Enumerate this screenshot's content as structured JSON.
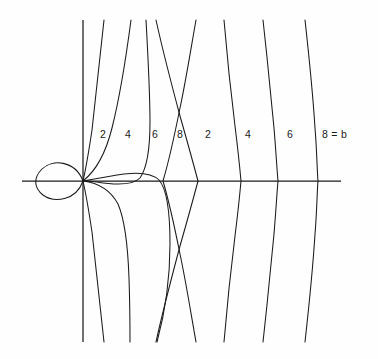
{
  "figure": {
    "title": "",
    "background_color": "#fefefe",
    "stroke_color": "#1a1a1a",
    "axes": {
      "origin": {
        "x": 83,
        "y": 181
      },
      "horizontal_axis": {
        "name": "x-axis",
        "x1": 22,
        "y1": 181,
        "x2": 341,
        "y2": 181
      },
      "vertical_axis": {
        "name": "y-axis",
        "x1": 83,
        "y1": 20,
        "x2": 83,
        "y2": 342
      }
    },
    "labels": [
      {
        "text": "2",
        "x": 103,
        "y": 134
      },
      {
        "text": "4",
        "x": 128,
        "y": 134
      },
      {
        "text": "6",
        "x": 155,
        "y": 134
      },
      {
        "text": "8",
        "x": 180,
        "y": 134
      },
      {
        "text": "2",
        "x": 208,
        "y": 134
      },
      {
        "text": "4",
        "x": 248,
        "y": 134
      },
      {
        "text": "6",
        "x": 290,
        "y": 134
      },
      {
        "text": "8 = b",
        "x": 322,
        "y": 134
      }
    ],
    "loop": {
      "name": "cardioid-loop",
      "path": "M 83 181 C 75 160 52 159 42 169 C 33 178 34 188 43 195 C 54 203 76 201 83 181 Z",
      "left_extent_x": 38,
      "right_extent_x": 84,
      "top_extent_y": 161,
      "bottom_extent_y": 200
    },
    "curves": [
      {
        "name": "curve-left-2",
        "label": "2",
        "axis_crossing_x": null,
        "path": "M 104 20 C 100 58 96 96 92 130 C 89 150 86 168 83 181 C 86 194 89 212 92 232 C 96 266 100 304 104 342"
      },
      {
        "name": "curve-left-4",
        "label": "4",
        "axis_crossing_x": 121,
        "path": "M 131 20 C 126 58 120 96 112 128 C 106 152 97 170 83 181 C 99 183 111 191 118 204 C 125 220 128 250 129 278 C 130 308 130 328 130 342"
      },
      {
        "name": "curve-left-6",
        "label": "6",
        "axis_crossing_x": 159,
        "path": "M 146 20 C 148 56 150 92 150 122 C 150 148 147 168 140 178 C 132 186 115 185 97 182 C 89 181 85 181 83 181 C 94 179 110 176 124 174 C 140 172 152 173 159 180 C 167 189 170 212 170 244 C 170 284 163 320 157 342"
      },
      {
        "name": "curve-left-8",
        "label": "8",
        "axis_crossing_x": 198,
        "path": "M 156 20 C 163 52 172 86 180 116 C 188 144 194 166 198 181 C 194 196 188 218 180 246 C 172 276 163 310 156 342"
      },
      {
        "name": "curve-right-2",
        "label": "2",
        "axis_crossing_x": 198,
        "path": "M 196 20 C 191 48 186 80 180 108 C 174 138 168 164 163 181 C 168 198 174 224 180 254 C 186 282 191 314 196 342"
      },
      {
        "name": "curve-right-4",
        "label": "4",
        "axis_crossing_x": 240,
        "path": "M 224 20 C 227 56 231 94 235 126 C 238 150 240 170 241 181 C 240 192 238 212 235 236 C 231 268 227 306 224 342"
      },
      {
        "name": "curve-right-6",
        "label": "6",
        "axis_crossing_x": 277,
        "path": "M 263 20 C 267 56 271 96 274 128 C 276 152 277 170 278 181 C 277 192 276 210 274 234 C 271 266 267 306 263 342"
      },
      {
        "name": "curve-right-8",
        "label": "8 = b",
        "axis_crossing_x": 317,
        "path": "M 305 20 C 309 56 313 96 315 128 C 317 152 317 170 318 181 C 317 192 317 210 315 234 C 313 266 309 306 305 342"
      }
    ]
  }
}
